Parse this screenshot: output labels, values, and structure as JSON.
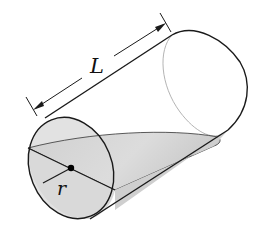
{
  "figure": {
    "labels": {
      "length": "L",
      "radius": "r"
    },
    "colors": {
      "outline": "#1a1a1a",
      "hidden_edge": "#b0b0b0",
      "wedge_fill": "#d4d4d4",
      "wedge_fill_light": "#e6e6e6",
      "center_point": "#000000"
    }
  }
}
